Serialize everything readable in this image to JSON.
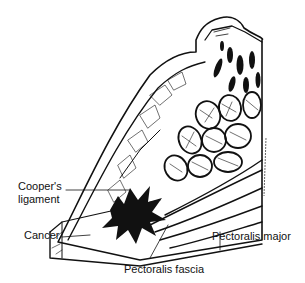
{
  "figure": {
    "colors": {
      "ink": "#111111",
      "background": "#ffffff"
    }
  },
  "labels": {
    "coopers_ligament_line1": "Cooper's",
    "coopers_ligament_line2": "ligament",
    "cancer": "Cancer",
    "pectoralis_fascia": "Pectoralis fascia",
    "pectoralis_major": "Pectoralis major"
  }
}
